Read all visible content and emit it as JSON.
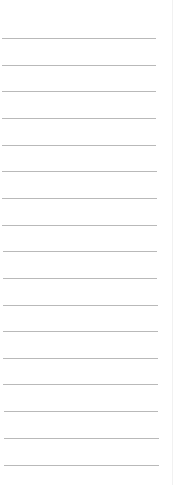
{
  "page": {
    "kind": "lined-paper",
    "background_color": "#ffffff",
    "line_color": "#b9b9b9",
    "edge_color": "#f1f1f1"
  },
  "lines": [
    {
      "y": 38,
      "x1": 2,
      "x2": 156
    },
    {
      "y": 65,
      "x1": 2,
      "x2": 156
    },
    {
      "y": 91,
      "x1": 2,
      "x2": 156
    },
    {
      "y": 118,
      "x1": 2,
      "x2": 156
    },
    {
      "y": 145,
      "x1": 2,
      "x2": 156
    },
    {
      "y": 171,
      "x1": 2,
      "x2": 157
    },
    {
      "y": 198,
      "x1": 2,
      "x2": 157
    },
    {
      "y": 225,
      "x1": 2,
      "x2": 157
    },
    {
      "y": 251,
      "x1": 3,
      "x2": 157
    },
    {
      "y": 278,
      "x1": 3,
      "x2": 157
    },
    {
      "y": 305,
      "x1": 3,
      "x2": 158
    },
    {
      "y": 331,
      "x1": 3,
      "x2": 158
    },
    {
      "y": 358,
      "x1": 3,
      "x2": 158
    },
    {
      "y": 384,
      "x1": 3,
      "x2": 158
    },
    {
      "y": 411,
      "x1": 4,
      "x2": 158
    },
    {
      "y": 438,
      "x1": 4,
      "x2": 159
    },
    {
      "y": 465,
      "x1": 4,
      "x2": 159
    }
  ]
}
